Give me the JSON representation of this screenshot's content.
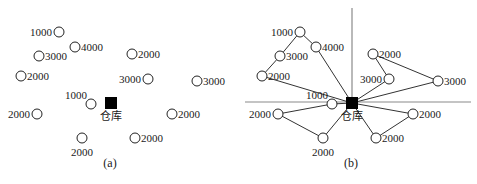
{
  "warehouse_label": "仓库",
  "colors": {
    "node_stroke": "#222222",
    "warehouse_fill": "#000000",
    "route_line": "#333333",
    "axis_line": "#8a8a8a"
  },
  "panel_a": {
    "caption": "(a)",
    "warehouse": {
      "x": 111,
      "y": 103
    },
    "customers": [
      {
        "id": "c1",
        "demand": "1000",
        "x": 59,
        "y": 32,
        "label_pos": "left"
      },
      {
        "id": "c2",
        "demand": "4000",
        "x": 75,
        "y": 47,
        "label_pos": "right"
      },
      {
        "id": "c3",
        "demand": "3000",
        "x": 39,
        "y": 56,
        "label_pos": "right"
      },
      {
        "id": "c4",
        "demand": "2000",
        "x": 132,
        "y": 54,
        "label_pos": "right"
      },
      {
        "id": "c5",
        "demand": "2000",
        "x": 21,
        "y": 76,
        "label_pos": "right"
      },
      {
        "id": "c6",
        "demand": "3000",
        "x": 148,
        "y": 79,
        "label_pos": "left"
      },
      {
        "id": "c7",
        "demand": "3000",
        "x": 197,
        "y": 81,
        "label_pos": "right"
      },
      {
        "id": "c8",
        "demand": "1000",
        "x": 91,
        "y": 104,
        "label_pos": "upper-left"
      },
      {
        "id": "c9",
        "demand": "2000",
        "x": 37,
        "y": 114,
        "label_pos": "left"
      },
      {
        "id": "c10",
        "demand": "2000",
        "x": 172,
        "y": 114,
        "label_pos": "right"
      },
      {
        "id": "c11",
        "demand": "2000",
        "x": 82,
        "y": 138,
        "label_pos": "below"
      },
      {
        "id": "c12",
        "demand": "2000",
        "x": 135,
        "y": 138,
        "label_pos": "right"
      }
    ]
  },
  "panel_b": {
    "caption": "(b)",
    "offset_x": 241,
    "axes": {
      "vertical_x": 352,
      "vertical_top": 8,
      "horizontal_y": 102,
      "horizontal_left": 245,
      "horizontal_right": 471
    },
    "routes": [
      {
        "name": "route-1",
        "stops": [
          "c5",
          "c3",
          "c1",
          "c2"
        ]
      },
      {
        "name": "route-2",
        "stops": [
          "c6",
          "c4",
          "c7"
        ]
      },
      {
        "name": "route-3",
        "stops": [
          "c8",
          "c9",
          "c11"
        ]
      },
      {
        "name": "route-4",
        "stops": [
          "c10",
          "c12"
        ]
      }
    ]
  }
}
